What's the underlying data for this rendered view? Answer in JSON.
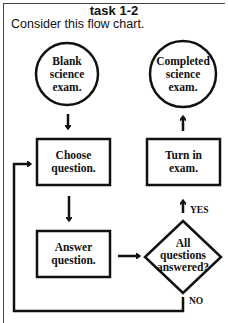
{
  "header": {
    "title": "task 1-2",
    "prompt": "Consider this flow chart."
  },
  "flowchart": {
    "nodes": [
      {
        "id": "start",
        "shape": "circle",
        "lines": [
          "Blank",
          "science",
          "exam."
        ]
      },
      {
        "id": "end",
        "shape": "circle",
        "lines": [
          "Completed",
          "science",
          "exam."
        ]
      },
      {
        "id": "choose",
        "shape": "rect",
        "lines": [
          "Choose",
          "question."
        ]
      },
      {
        "id": "turnin",
        "shape": "rect",
        "lines": [
          "Turn in",
          "exam."
        ]
      },
      {
        "id": "answer",
        "shape": "rect",
        "lines": [
          "Answer",
          "question."
        ]
      },
      {
        "id": "decision",
        "shape": "diamond",
        "lines": [
          "All",
          "questions",
          "answered?"
        ]
      }
    ],
    "edges": [
      {
        "from": "start",
        "to": "choose",
        "label": ""
      },
      {
        "from": "choose",
        "to": "answer",
        "label": ""
      },
      {
        "from": "answer",
        "to": "decision",
        "label": ""
      },
      {
        "from": "decision",
        "to": "turnin",
        "label": "YES"
      },
      {
        "from": "decision",
        "to": "choose",
        "label": "NO"
      },
      {
        "from": "turnin",
        "to": "end",
        "label": ""
      }
    ],
    "labels": {
      "yes": "YES",
      "no": "NO"
    }
  }
}
